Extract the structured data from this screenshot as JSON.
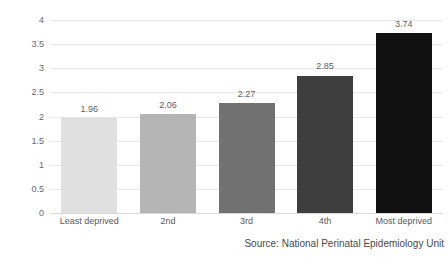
{
  "chart_data": {
    "type": "bar",
    "title": "",
    "xlabel": "",
    "ylabel": "Infant deaths per 1,000 live births",
    "ylim": [
      0,
      4
    ],
    "yticks": [
      "0",
      "0.5",
      "1",
      "1.5",
      "2",
      "2.5",
      "3",
      "3.5",
      "4"
    ],
    "ytick_values": [
      0,
      0.5,
      1,
      1.5,
      2,
      2.5,
      3,
      3.5,
      4
    ],
    "grid": true,
    "legend": "none",
    "categories": [
      "Least deprived",
      "2nd",
      "3rd",
      "4th",
      "Most deprived"
    ],
    "values": [
      1.96,
      2.06,
      2.27,
      2.85,
      3.74
    ],
    "value_labels": [
      "1.96",
      "2.06",
      "2.27",
      "2.85",
      "3.74"
    ],
    "bar_colors": [
      "#e0e0e0",
      "#b5b5b5",
      "#717171",
      "#3e3e3e",
      "#111111"
    ],
    "annotations": [
      "Source: National Perinatal Epidemiology Unit"
    ]
  },
  "source": {
    "text": "Source: National Perinatal Epidemiology Unit"
  },
  "colors": {
    "gridline": "#e8e8e8",
    "baseline": "#d9d9d9",
    "text": "#5a5a5a",
    "background": "#ffffff"
  }
}
